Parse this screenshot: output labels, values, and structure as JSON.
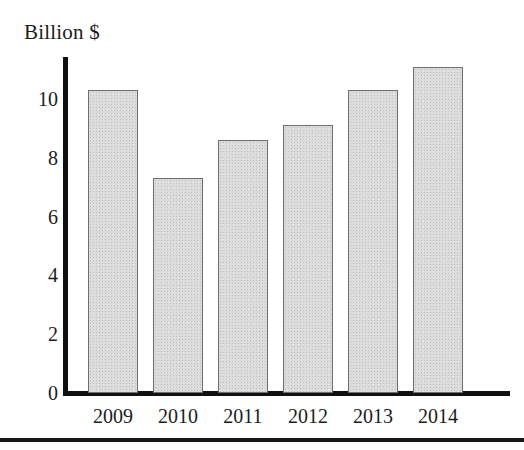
{
  "chart_data": {
    "type": "bar",
    "title": "",
    "subtitle": "",
    "xlabel": "",
    "ylabel": "Billion $",
    "unit_label": "Billion $",
    "categories": [
      "2009",
      "2010",
      "2011",
      "2012",
      "2013",
      "2014"
    ],
    "values": [
      10.3,
      7.3,
      8.6,
      9.1,
      10.3,
      11.1
    ],
    "series": [
      {
        "name": "Billion $",
        "values": [
          10.3,
          7.3,
          8.6,
          9.1,
          10.3,
          11.1
        ]
      }
    ],
    "ylim": [
      0,
      11.4
    ],
    "xlim_note": "categorical",
    "yticks": [
      0,
      2,
      4,
      6,
      8,
      10
    ],
    "ytick_labels": [
      "0",
      "2",
      "4",
      "6",
      "8",
      "10"
    ],
    "grid": false,
    "legend": false,
    "legend_position": "none",
    "annotations": [],
    "colors": {
      "bar_fill": "#dcdcdc",
      "bar_border": "#6e6e6e",
      "axis": "#111111",
      "text": "#1c1c1c",
      "background": "#ffffff",
      "bottom_rule": "#171717"
    }
  },
  "figure": {
    "unit_label": "Billion $",
    "bottom_rule_visible": true
  }
}
